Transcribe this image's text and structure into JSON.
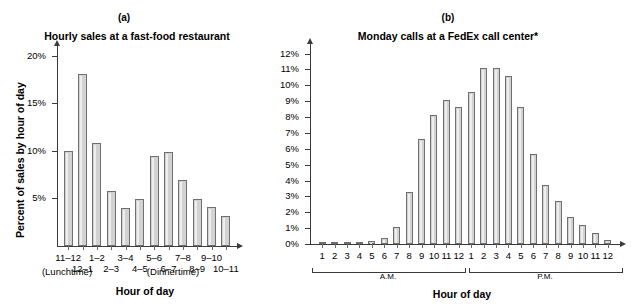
{
  "figure": {
    "panels": [
      {
        "letter": "(a)",
        "title": "Hourly sales at a fast-food restaurant",
        "ylabel": "Percent of sales by hour of day",
        "xlabel": "Hour of day",
        "ytick_labels": [
          "20%",
          "15%",
          "10%",
          "5%"
        ],
        "notes": [
          "(Lunchtime)",
          "(Dinnertime)"
        ]
      },
      {
        "letter": "(b)",
        "title": "Monday calls at a FedEx call center*",
        "ylabel": "",
        "xlabel": "Hour of day",
        "ytick_labels": [
          "12%",
          "11%",
          "10%",
          "9%",
          "8%",
          "7%",
          "6%",
          "5%",
          "4%",
          "3%",
          "2%",
          "1%",
          "0%"
        ],
        "notes": [
          "A.M.",
          "P.M."
        ]
      }
    ]
  },
  "chart_data": [
    {
      "type": "bar",
      "title": "Hourly sales at a fast-food restaurant",
      "panel": "(a)",
      "xlabel": "Hour of day",
      "ylabel": "Percent of sales by hour of day",
      "ylim": [
        0,
        21
      ],
      "yticks": [
        5,
        10,
        15,
        20
      ],
      "ytick_labels": [
        "5%",
        "10%",
        "15%",
        "20%"
      ],
      "grid": false,
      "legend": "none",
      "annotations": [
        "(Lunchtime)",
        "(Dinnertime)"
      ],
      "categories": [
        "11–12",
        "12–1",
        "1–2",
        "2–3",
        "3–4",
        "4–5",
        "5–6",
        "6–7",
        "7–8",
        "8–9",
        "9–10",
        "10–11"
      ],
      "values": [
        10.0,
        18.1,
        10.8,
        5.8,
        4.0,
        4.9,
        9.4,
        9.9,
        6.9,
        4.9,
        4.1,
        3.1
      ]
    },
    {
      "type": "bar",
      "title": "Monday calls at a FedEx call center*",
      "panel": "(b)",
      "xlabel": "Hour of day",
      "ylabel": "",
      "ylim": [
        0,
        12.6
      ],
      "yticks": [
        0,
        1,
        2,
        3,
        4,
        5,
        6,
        7,
        8,
        9,
        10,
        11,
        12
      ],
      "ytick_labels": [
        "0%",
        "1%",
        "2%",
        "3%",
        "4%",
        "5%",
        "6%",
        "7%",
        "8%",
        "9%",
        "10%",
        "11%",
        "12%"
      ],
      "grid": false,
      "legend": "none",
      "annotations": [
        "A.M.",
        "P.M."
      ],
      "categories": [
        "1",
        "2",
        "3",
        "4",
        "5",
        "6",
        "7",
        "8",
        "9",
        "10",
        "11",
        "12",
        "1",
        "2",
        "3",
        "4",
        "5",
        "6",
        "7",
        "8",
        "9",
        "10",
        "11",
        "12"
      ],
      "values": [
        0.15,
        0.15,
        0.15,
        0.15,
        0.2,
        0.35,
        1.1,
        3.3,
        6.6,
        8.1,
        9.1,
        8.6,
        9.6,
        11.1,
        11.1,
        10.6,
        8.6,
        5.7,
        3.7,
        2.7,
        1.7,
        1.2,
        0.7,
        0.25
      ]
    }
  ]
}
